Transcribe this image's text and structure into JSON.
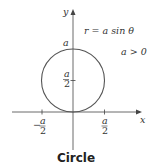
{
  "diagram": {
    "title": "Circle",
    "equation": "r = a sin θ",
    "condition": "a > 0",
    "axes": {
      "x_label": "x",
      "y_label": "y"
    },
    "y_ticks": [
      {
        "label_num": "a",
        "label_den": "2"
      }
    ],
    "y_top_label": "a",
    "x_ticks": [
      {
        "sign": "−",
        "label_num": "a",
        "label_den": "2"
      },
      {
        "sign": "",
        "label_num": "a",
        "label_den": "2"
      }
    ],
    "colors": {
      "curve": "#555555",
      "axis": "#444444"
    }
  }
}
